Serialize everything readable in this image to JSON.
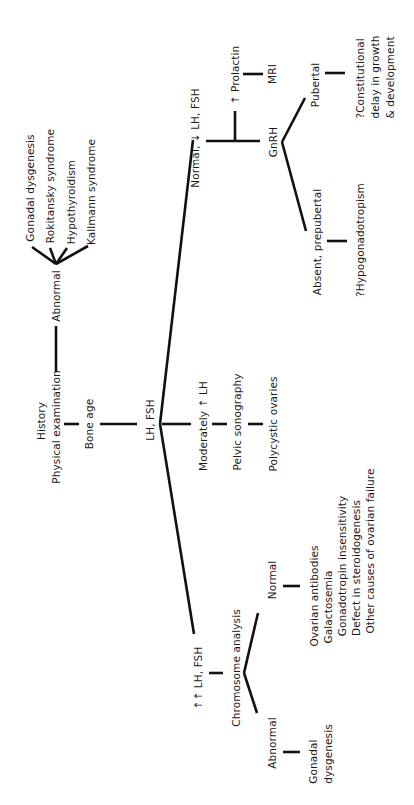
{
  "diagram": {
    "orientation": "rotated-90-counterclockwise",
    "root": {
      "history": "History",
      "physical_exam": "Physical examination",
      "abnormal_branch": {
        "label": "Abnormal",
        "outcomes": [
          "Gonadal dysgenesis",
          "Rokitansky syndrome",
          "Hypothyroidism",
          "Kallmann syndrome"
        ]
      },
      "bone_age": "Bone age",
      "lh_fsh": "LH, FSH"
    },
    "high_branch": {
      "label": "↑↑ LH, FSH",
      "test": "Chromosome analysis",
      "abnormal": {
        "label": "Abnormal",
        "outcome": "Gonadal\ndysgenesis"
      },
      "normal": {
        "label": "Normal",
        "outcomes": [
          "Ovarian antibodies",
          "Galactosemia",
          "Gonadotropin insensitivity",
          "Defect in steroidogenesis",
          "Other causes of ovarian failure"
        ]
      }
    },
    "moderate_branch": {
      "label": "Moderately ↑ LH",
      "test": "Pelvic sonography",
      "outcome": "Polycystic ovaries"
    },
    "low_branch": {
      "label": "Normal, ↓ LH, FSH",
      "prolactin": "↑ Prolactin",
      "mri": "MRI",
      "test": "GnRH",
      "pubertal": {
        "label": "Pubertal",
        "outcome": "?Constitutional\ndelay in growth\n& development"
      },
      "prepubertal": {
        "label": "Absent, prepubertal",
        "outcome": "?Hypogonadotropism"
      }
    }
  },
  "colors": {
    "background": "#ffffff",
    "ink": "#1a1a1a"
  }
}
